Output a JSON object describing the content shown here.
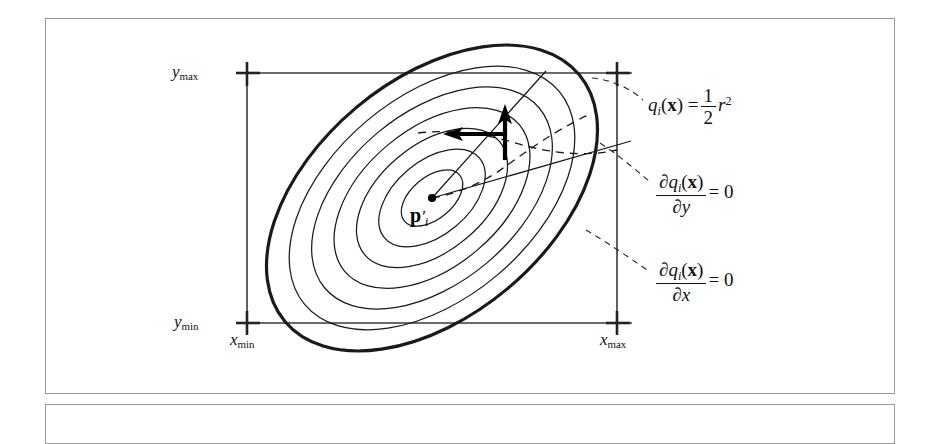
{
  "figure": {
    "type": "geometry-diagram",
    "axis_labels": {
      "y_max": {
        "var": "y",
        "sub": "max"
      },
      "y_min": {
        "var": "y",
        "sub": "min"
      },
      "x_min": {
        "var": "x",
        "sub": "min"
      },
      "x_max": {
        "var": "x",
        "sub": "max"
      }
    },
    "center_point": {
      "symbol": "p",
      "prime": "′",
      "sub": "i"
    },
    "callouts": [
      {
        "id": "q-definition",
        "lhs_fn": "q",
        "lhs_sub": "i",
        "lhs_arg": "x",
        "equals": "=",
        "frac_num": "1",
        "frac_den": "2",
        "rhs_var": "r",
        "rhs_exp": "2",
        "plain": "q_i(x) = 1/2 r^2"
      },
      {
        "id": "dq-dy-zero",
        "partial": "∂",
        "fn": "q",
        "sub": "i",
        "arg": "x",
        "wrt": "y",
        "equals": "=",
        "value": "0",
        "plain": "∂q_i(x)/∂y = 0"
      },
      {
        "id": "dq-dx-zero",
        "partial": "∂",
        "fn": "q",
        "sub": "i",
        "arg": "x",
        "wrt": "x",
        "equals": "=",
        "value": "0",
        "plain": "∂q_i(x)/∂x = 0"
      }
    ],
    "arrows": [
      {
        "id": "gradient-y-arrow",
        "direction": "up"
      },
      {
        "id": "gradient-x-arrow",
        "direction": "left"
      }
    ],
    "contour_count": 7,
    "colors": {
      "ink": "#111111",
      "frame": "#9a9a9a",
      "axis": "#3a3a3a",
      "paper": "#ffffff"
    }
  }
}
